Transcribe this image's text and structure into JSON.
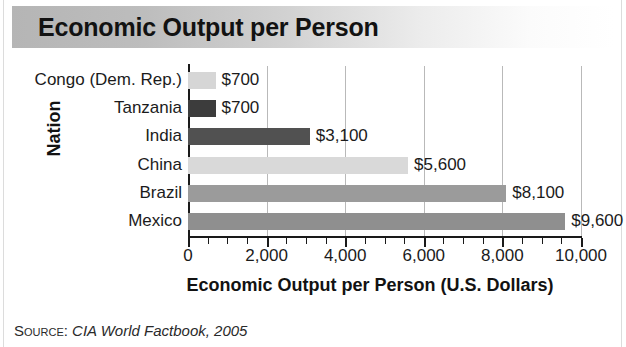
{
  "title": "Economic Output per Person",
  "source": {
    "label": "Source:",
    "text": "CIA World Factbook, 2005"
  },
  "axes": {
    "y_title": "Nation",
    "x_title": "Economic Output per Person (U.S. Dollars)"
  },
  "chart_data": {
    "type": "bar",
    "orientation": "horizontal",
    "title": "Economic Output per Person",
    "xlabel": "Economic Output per Person (U.S. Dollars)",
    "ylabel": "Nation",
    "xlim": [
      0,
      10000
    ],
    "xticks": [
      0,
      2000,
      4000,
      6000,
      8000,
      10000
    ],
    "xtick_labels": [
      "0",
      "2,000",
      "4,000",
      "6,000",
      "8,000",
      "10,000"
    ],
    "minor_tick_interval": 500,
    "grid": "vertical",
    "legend": "none",
    "categories": [
      "Congo (Dem. Rep.)",
      "Tanzania",
      "India",
      "China",
      "Brazil",
      "Mexico"
    ],
    "values": [
      700,
      700,
      3100,
      5600,
      8100,
      9600
    ],
    "value_labels": [
      "$700",
      "$700",
      "$3,100",
      "$5,600",
      "$8,100",
      "$9,600"
    ],
    "bar_colors": [
      "#d6d6d6",
      "#3c3c3c",
      "#515151",
      "#d9d9d9",
      "#9b9b9b",
      "#8f8f8f"
    ]
  },
  "colors": {
    "axis": "#1a1a1a",
    "gridline": "#b9b9b9",
    "text": "#1b1b1b",
    "banner_start": "#b5b5b5",
    "banner_end": "#ffffff"
  }
}
